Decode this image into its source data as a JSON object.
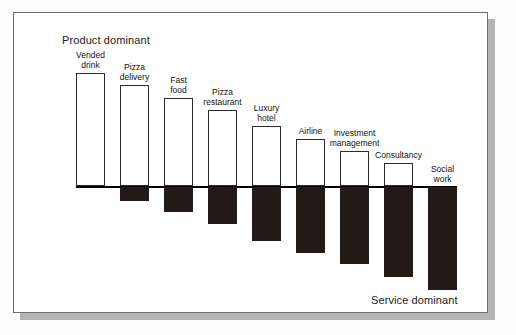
{
  "figure": {
    "top_label": "Product dominant",
    "bottom_label": "Service dominant"
  },
  "chart_data": {
    "type": "bar",
    "title": "",
    "subtitle": "",
    "xlabel": "",
    "ylabel": "",
    "grid": false,
    "legend": false,
    "axis_note": "Diverging bar chart on a goods-service (tangibility) continuum. Positive (white outlined) portion = product/tangible dominant share; negative (solid black) portion = service/intangible dominant share. Values are percentages of the bar read off the zero baseline.",
    "annotations": [
      "Product dominant",
      "Service dominant"
    ],
    "ylim": [
      -100,
      100
    ],
    "categories": [
      "Vended drink",
      "Pizza delivery",
      "Fast food",
      "Pizza restaurant",
      "Luxury hotel",
      "Airline",
      "Investment management",
      "Consultancy",
      "Social work"
    ],
    "series": [
      {
        "name": "Product (tangible) dominant",
        "values": [
          100,
          88,
          78,
          68,
          53,
          42,
          33,
          22,
          0
        ]
      },
      {
        "name": "Service (intangible) dominant",
        "values": [
          0,
          -12,
          -22,
          -32,
          -47,
          -58,
          -67,
          -78,
          -100
        ]
      }
    ]
  },
  "bars": [
    {
      "label": "Vended\ndrink",
      "name": "bar-vended-drink",
      "x": 62,
      "width": 29,
      "pos_top": 60,
      "pos_height": 113,
      "neg_height": 0,
      "label_top": 38
    },
    {
      "label": "Pizza\ndelivery",
      "name": "bar-pizza-delivery",
      "x": 106,
      "width": 29,
      "pos_top": 72,
      "pos_height": 101,
      "neg_height": 14,
      "label_top": 50
    },
    {
      "label": "Fast\nfood",
      "name": "bar-fast-food",
      "x": 150,
      "width": 29,
      "pos_top": 85,
      "pos_height": 88,
      "neg_height": 25,
      "label_top": 63
    },
    {
      "label": "Pizza\nrestaurant",
      "name": "bar-pizza-restaurant",
      "x": 194,
      "width": 29,
      "pos_top": 97,
      "pos_height": 76,
      "neg_height": 37,
      "label_top": 75
    },
    {
      "label": "Luxury\nhotel",
      "name": "bar-luxury-hotel",
      "x": 238,
      "width": 29,
      "pos_top": 113,
      "pos_height": 60,
      "neg_height": 54,
      "label_top": 91
    },
    {
      "label": "Airline",
      "name": "bar-airline",
      "x": 282,
      "width": 29,
      "pos_top": 126,
      "pos_height": 47,
      "neg_height": 66,
      "label_top": 114
    },
    {
      "label": "Investment\nmanagement",
      "name": "bar-investment-management",
      "x": 326,
      "width": 29,
      "pos_top": 138,
      "pos_height": 35,
      "neg_height": 77,
      "label_top": 116
    },
    {
      "label": "Consultancy",
      "name": "bar-consultancy",
      "x": 370,
      "width": 29,
      "pos_top": 150,
      "pos_height": 23,
      "neg_height": 90,
      "label_top": 138
    },
    {
      "label": "Social\nwork",
      "name": "bar-social-work",
      "x": 414,
      "width": 29,
      "pos_top": 173,
      "pos_height": 0,
      "neg_height": 103,
      "label_top": 152
    }
  ]
}
